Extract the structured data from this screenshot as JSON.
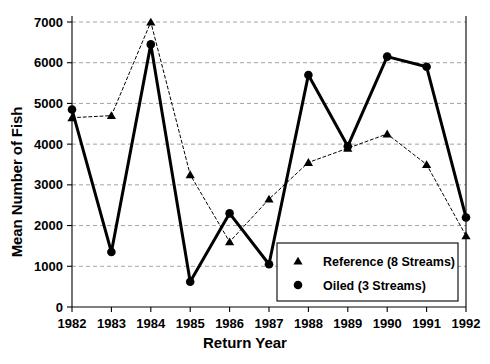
{
  "chart_data": {
    "type": "line",
    "title": "",
    "xlabel": "Return Year",
    "ylabel": "Mean Number of Fish",
    "categories": [
      "1982",
      "1983",
      "1984",
      "1985",
      "1986",
      "1987",
      "1988",
      "1989",
      "1990",
      "1991",
      "1992"
    ],
    "x": [
      1982,
      1983,
      1984,
      1985,
      1986,
      1987,
      1988,
      1989,
      1990,
      1991,
      1992
    ],
    "xlim": [
      1982,
      1992
    ],
    "ylim": [
      0,
      7000
    ],
    "yticks": [
      0,
      1000,
      2000,
      3000,
      4000,
      5000,
      6000,
      7000
    ],
    "ytick_labels": [
      "0",
      "1000",
      "2000",
      "3000",
      "4000",
      "5000",
      "6000",
      "7000"
    ],
    "xtick_labels": [
      "1982",
      "1983",
      "1984",
      "1985",
      "1986",
      "1987",
      "1988",
      "1989",
      "1990",
      "1991",
      "1992"
    ],
    "grid": "horizontal-dashed",
    "legend_position": "bottom-right-inside",
    "series": [
      {
        "name": "Reference (8 Streams)",
        "marker": "triangle",
        "line_style": "dotted",
        "line_width": 1,
        "color": "#000000",
        "values": [
          4650,
          4700,
          7000,
          3250,
          1600,
          2650,
          3550,
          3900,
          4250,
          3500,
          1750
        ]
      },
      {
        "name": "Oiled (3 Streams)",
        "marker": "circle",
        "line_style": "solid",
        "line_width": 3,
        "color": "#000000",
        "values": [
          4850,
          1350,
          6450,
          620,
          2300,
          1050,
          5700,
          3950,
          6150,
          5900,
          2200
        ]
      }
    ]
  },
  "axes": {
    "ylabel": "Mean Number of Fish",
    "xlabel": "Return Year"
  },
  "legend": {
    "items": [
      {
        "label": "Reference (8 Streams)",
        "marker": "triangle"
      },
      {
        "label": "Oiled (3 Streams)",
        "marker": "circle"
      }
    ]
  },
  "colors": {
    "ink": "#000000",
    "grid": "#9a9a9a",
    "background": "#ffffff"
  }
}
